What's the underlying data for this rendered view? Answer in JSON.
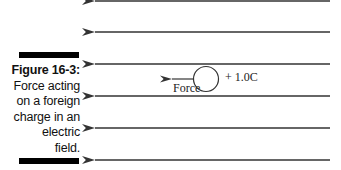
{
  "figure": {
    "label": "Figure 16-3:",
    "caption_lines": [
      "Force acting",
      "on a foreign",
      "charge in an",
      "electric",
      "field."
    ]
  },
  "diagram": {
    "field_lines_y": [
      1,
      32,
      64,
      96,
      128,
      160
    ],
    "field_direction": "left",
    "charge_label": "+ 1.0C",
    "force_label": "Force",
    "line_color": "#333333"
  }
}
